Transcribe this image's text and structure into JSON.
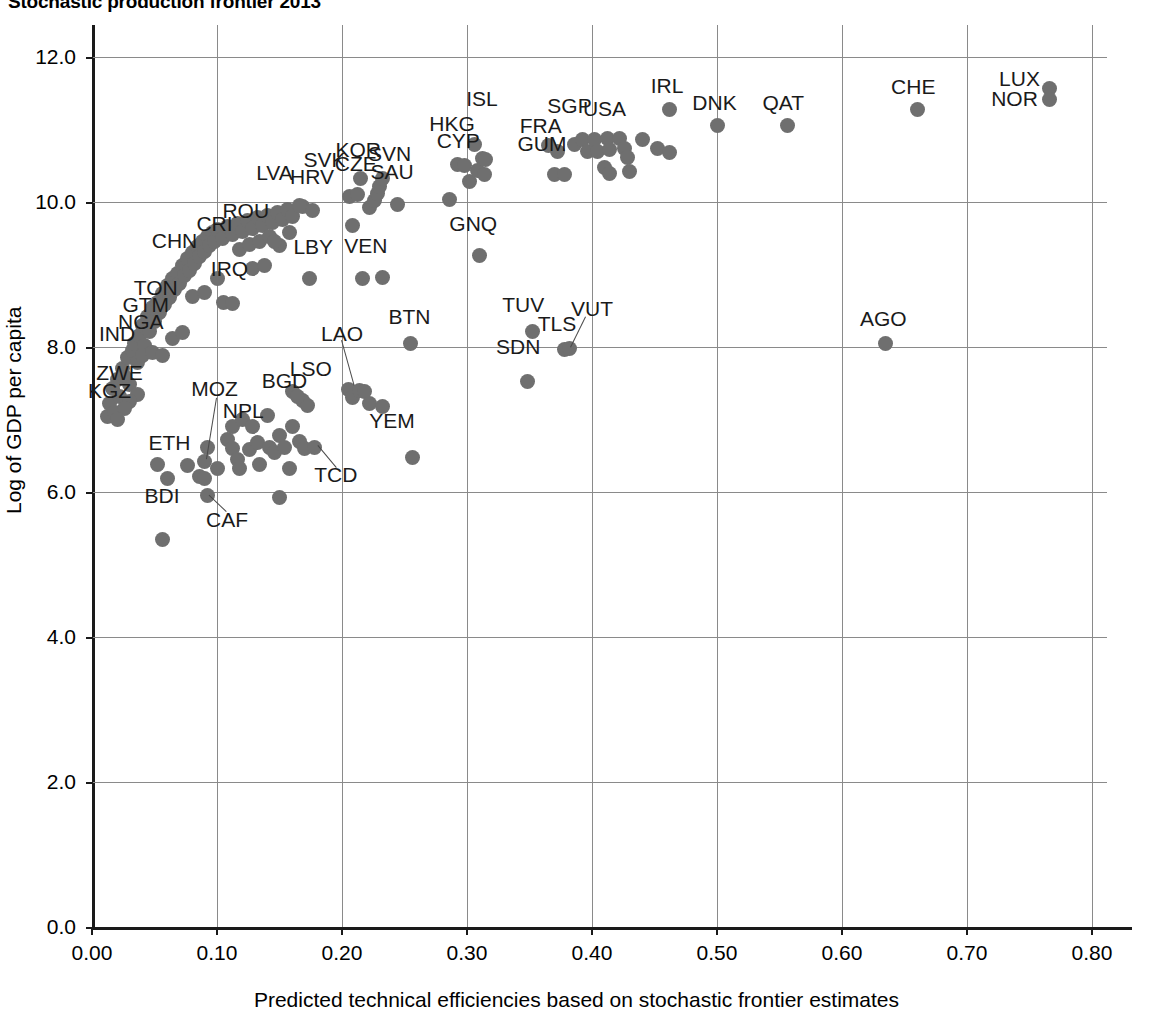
{
  "title": "Stochastic production frontier 2013",
  "axes": {
    "x_title": "Predicted technical efficiencies based on stochastic frontier estimates",
    "y_title": "Log of GDP per capita",
    "x_ticks": [
      "0.00",
      "0.10",
      "0.20",
      "0.30",
      "0.40",
      "0.50",
      "0.60",
      "0.70",
      "0.80"
    ],
    "y_ticks": [
      "0.0",
      "2.0",
      "4.0",
      "6.0",
      "8.0",
      "10.0",
      "12.0"
    ]
  },
  "style": {
    "point_color": "#6f6f6f",
    "grid_color": "#8a8a8a",
    "axis_color": "#1a1a1a"
  },
  "chart_data": {
    "type": "scatter",
    "title": "Stochastic production frontier 2013",
    "xlabel": "Predicted technical efficiencies based on stochastic frontier estimates",
    "ylabel": "Log of GDP per capita",
    "xlim": [
      0.0,
      0.8
    ],
    "ylim": [
      0.0,
      12.0
    ],
    "xticks": [
      0.0,
      0.1,
      0.2,
      0.3,
      0.4,
      0.5,
      0.6,
      0.7,
      0.8
    ],
    "yticks": [
      0.0,
      2.0,
      4.0,
      6.0,
      8.0,
      10.0,
      12.0
    ],
    "grid": true,
    "legend": "none",
    "marker": "filled-circle",
    "points": [
      {
        "x": 0.012,
        "y": 7.04
      },
      {
        "x": 0.014,
        "y": 7.22
      },
      {
        "x": 0.016,
        "y": 7.43
      },
      {
        "x": 0.018,
        "y": 7.1
      },
      {
        "x": 0.02,
        "y": 7.55
      },
      {
        "x": 0.022,
        "y": 7.32
      },
      {
        "x": 0.024,
        "y": 7.7
      },
      {
        "x": 0.026,
        "y": 7.6
      },
      {
        "x": 0.028,
        "y": 7.85
      },
      {
        "x": 0.03,
        "y": 7.48
      },
      {
        "x": 0.032,
        "y": 7.95
      },
      {
        "x": 0.034,
        "y": 8.05
      },
      {
        "x": 0.036,
        "y": 7.78
      },
      {
        "x": 0.038,
        "y": 8.16
      },
      {
        "x": 0.04,
        "y": 8.3
      },
      {
        "x": 0.042,
        "y": 8.02
      },
      {
        "x": 0.044,
        "y": 8.42
      },
      {
        "x": 0.046,
        "y": 8.22
      },
      {
        "x": 0.048,
        "y": 8.55
      },
      {
        "x": 0.05,
        "y": 8.35
      },
      {
        "x": 0.052,
        "y": 8.62
      },
      {
        "x": 0.054,
        "y": 8.48
      },
      {
        "x": 0.056,
        "y": 8.74
      },
      {
        "x": 0.058,
        "y": 8.58
      },
      {
        "x": 0.06,
        "y": 8.85
      },
      {
        "x": 0.062,
        "y": 8.68
      },
      {
        "x": 0.064,
        "y": 8.95
      },
      {
        "x": 0.066,
        "y": 8.8
      },
      {
        "x": 0.068,
        "y": 9.02
      },
      {
        "x": 0.07,
        "y": 8.88
      },
      {
        "x": 0.072,
        "y": 9.12
      },
      {
        "x": 0.074,
        "y": 8.98
      },
      {
        "x": 0.076,
        "y": 9.22
      },
      {
        "x": 0.078,
        "y": 9.05
      },
      {
        "x": 0.08,
        "y": 9.3
      },
      {
        "x": 0.082,
        "y": 9.15
      },
      {
        "x": 0.084,
        "y": 9.38
      },
      {
        "x": 0.086,
        "y": 9.25
      },
      {
        "x": 0.088,
        "y": 9.45
      },
      {
        "x": 0.09,
        "y": 9.32
      },
      {
        "x": 0.092,
        "y": 9.52
      },
      {
        "x": 0.094,
        "y": 9.4
      },
      {
        "x": 0.096,
        "y": 9.58
      },
      {
        "x": 0.098,
        "y": 9.46
      },
      {
        "x": 0.1,
        "y": 9.62
      },
      {
        "x": 0.104,
        "y": 9.5
      },
      {
        "x": 0.108,
        "y": 9.66
      },
      {
        "x": 0.112,
        "y": 9.55
      },
      {
        "x": 0.116,
        "y": 9.7
      },
      {
        "x": 0.12,
        "y": 9.6
      },
      {
        "x": 0.124,
        "y": 9.74
      },
      {
        "x": 0.128,
        "y": 9.64
      },
      {
        "x": 0.132,
        "y": 9.78
      },
      {
        "x": 0.136,
        "y": 9.68
      },
      {
        "x": 0.14,
        "y": 9.82
      },
      {
        "x": 0.144,
        "y": 9.72
      },
      {
        "x": 0.148,
        "y": 9.86
      },
      {
        "x": 0.152,
        "y": 9.76
      },
      {
        "x": 0.156,
        "y": 9.9
      },
      {
        "x": 0.16,
        "y": 9.8
      },
      {
        "x": 0.168,
        "y": 9.94
      },
      {
        "x": 0.176,
        "y": 9.88
      },
      {
        "x": 0.08,
        "y": 8.7
      },
      {
        "x": 0.09,
        "y": 8.75
      },
      {
        "x": 0.1,
        "y": 8.95
      },
      {
        "x": 0.105,
        "y": 8.62
      },
      {
        "x": 0.112,
        "y": 8.6
      },
      {
        "x": 0.118,
        "y": 9.35
      },
      {
        "x": 0.126,
        "y": 9.42
      },
      {
        "x": 0.134,
        "y": 9.46
      },
      {
        "x": 0.142,
        "y": 9.52
      },
      {
        "x": 0.15,
        "y": 9.4
      },
      {
        "x": 0.158,
        "y": 9.58
      },
      {
        "x": 0.166,
        "y": 9.95
      },
      {
        "x": 0.174,
        "y": 8.94
      },
      {
        "x": 0.128,
        "y": 9.08
      },
      {
        "x": 0.138,
        "y": 9.12
      },
      {
        "x": 0.146,
        "y": 9.45
      },
      {
        "x": 0.04,
        "y": 7.88
      },
      {
        "x": 0.048,
        "y": 7.92
      },
      {
        "x": 0.056,
        "y": 7.88
      },
      {
        "x": 0.064,
        "y": 8.12
      },
      {
        "x": 0.072,
        "y": 8.2
      },
      {
        "x": 0.036,
        "y": 7.35
      },
      {
        "x": 0.03,
        "y": 7.25
      },
      {
        "x": 0.026,
        "y": 7.15
      },
      {
        "x": 0.02,
        "y": 7.0
      },
      {
        "x": 0.052,
        "y": 6.38
      },
      {
        "x": 0.06,
        "y": 6.18
      },
      {
        "x": 0.076,
        "y": 6.36
      },
      {
        "x": 0.086,
        "y": 6.22
      },
      {
        "x": 0.09,
        "y": 6.18
      },
      {
        "x": 0.09,
        "y": 6.42
      },
      {
        "x": 0.092,
        "y": 6.62
      },
      {
        "x": 0.092,
        "y": 5.95
      },
      {
        "x": 0.1,
        "y": 6.32
      },
      {
        "x": 0.056,
        "y": 5.35
      },
      {
        "x": 0.108,
        "y": 6.72
      },
      {
        "x": 0.112,
        "y": 6.6
      },
      {
        "x": 0.112,
        "y": 6.9
      },
      {
        "x": 0.116,
        "y": 6.45
      },
      {
        "x": 0.118,
        "y": 6.32
      },
      {
        "x": 0.12,
        "y": 7.0
      },
      {
        "x": 0.126,
        "y": 6.58
      },
      {
        "x": 0.128,
        "y": 6.9
      },
      {
        "x": 0.132,
        "y": 6.68
      },
      {
        "x": 0.134,
        "y": 6.38
      },
      {
        "x": 0.14,
        "y": 7.05
      },
      {
        "x": 0.142,
        "y": 6.62
      },
      {
        "x": 0.146,
        "y": 6.55
      },
      {
        "x": 0.15,
        "y": 6.78
      },
      {
        "x": 0.154,
        "y": 6.62
      },
      {
        "x": 0.158,
        "y": 6.32
      },
      {
        "x": 0.16,
        "y": 6.9
      },
      {
        "x": 0.166,
        "y": 6.7
      },
      {
        "x": 0.17,
        "y": 6.6
      },
      {
        "x": 0.168,
        "y": 7.26
      },
      {
        "x": 0.172,
        "y": 7.2
      },
      {
        "x": 0.16,
        "y": 7.38
      },
      {
        "x": 0.164,
        "y": 7.32
      },
      {
        "x": 0.178,
        "y": 6.62
      },
      {
        "x": 0.15,
        "y": 5.92
      },
      {
        "x": 0.205,
        "y": 7.42
      },
      {
        "x": 0.208,
        "y": 7.3
      },
      {
        "x": 0.214,
        "y": 7.4
      },
      {
        "x": 0.218,
        "y": 7.38
      },
      {
        "x": 0.222,
        "y": 7.22
      },
      {
        "x": 0.232,
        "y": 7.18
      },
      {
        "x": 0.256,
        "y": 6.48
      },
      {
        "x": 0.255,
        "y": 8.05
      },
      {
        "x": 0.206,
        "y": 10.08
      },
      {
        "x": 0.208,
        "y": 9.68
      },
      {
        "x": 0.212,
        "y": 10.1
      },
      {
        "x": 0.215,
        "y": 10.32
      },
      {
        "x": 0.222,
        "y": 9.92
      },
      {
        "x": 0.226,
        "y": 10.02
      },
      {
        "x": 0.228,
        "y": 10.12
      },
      {
        "x": 0.23,
        "y": 10.22
      },
      {
        "x": 0.232,
        "y": 10.32
      },
      {
        "x": 0.244,
        "y": 9.96
      },
      {
        "x": 0.216,
        "y": 8.94
      },
      {
        "x": 0.232,
        "y": 8.96
      },
      {
        "x": 0.286,
        "y": 10.04
      },
      {
        "x": 0.292,
        "y": 10.52
      },
      {
        "x": 0.298,
        "y": 10.5
      },
      {
        "x": 0.302,
        "y": 10.28
      },
      {
        "x": 0.306,
        "y": 10.8
      },
      {
        "x": 0.308,
        "y": 10.44
      },
      {
        "x": 0.312,
        "y": 10.6
      },
      {
        "x": 0.315,
        "y": 10.58
      },
      {
        "x": 0.314,
        "y": 10.38
      },
      {
        "x": 0.31,
        "y": 9.26
      },
      {
        "x": 0.348,
        "y": 7.52
      },
      {
        "x": 0.352,
        "y": 8.22
      },
      {
        "x": 0.378,
        "y": 7.96
      },
      {
        "x": 0.382,
        "y": 7.98
      },
      {
        "x": 0.365,
        "y": 10.78
      },
      {
        "x": 0.372,
        "y": 10.7
      },
      {
        "x": 0.37,
        "y": 10.38
      },
      {
        "x": 0.378,
        "y": 10.38
      },
      {
        "x": 0.386,
        "y": 10.8
      },
      {
        "x": 0.392,
        "y": 10.86
      },
      {
        "x": 0.396,
        "y": 10.7
      },
      {
        "x": 0.402,
        "y": 10.86
      },
      {
        "x": 0.404,
        "y": 10.7
      },
      {
        "x": 0.412,
        "y": 10.88
      },
      {
        "x": 0.414,
        "y": 10.72
      },
      {
        "x": 0.41,
        "y": 10.48
      },
      {
        "x": 0.414,
        "y": 10.4
      },
      {
        "x": 0.422,
        "y": 10.88
      },
      {
        "x": 0.426,
        "y": 10.74
      },
      {
        "x": 0.428,
        "y": 10.62
      },
      {
        "x": 0.43,
        "y": 10.42
      },
      {
        "x": 0.44,
        "y": 10.86
      },
      {
        "x": 0.452,
        "y": 10.74
      },
      {
        "x": 0.462,
        "y": 11.28
      },
      {
        "x": 0.462,
        "y": 10.68
      },
      {
        "x": 0.5,
        "y": 11.06
      },
      {
        "x": 0.556,
        "y": 11.06
      },
      {
        "x": 0.635,
        "y": 8.05
      },
      {
        "x": 0.66,
        "y": 11.28
      },
      {
        "x": 0.766,
        "y": 11.56
      },
      {
        "x": 0.766,
        "y": 11.42
      }
    ],
    "labels": [
      {
        "text": "LUX",
        "x": 0.742,
        "y": 11.7
      },
      {
        "text": "NOR",
        "x": 0.738,
        "y": 11.42
      },
      {
        "text": "CHE",
        "x": 0.657,
        "y": 11.58
      },
      {
        "text": "QAT",
        "x": 0.553,
        "y": 11.37
      },
      {
        "text": "DNK",
        "x": 0.498,
        "y": 11.37
      },
      {
        "text": "IRL",
        "x": 0.46,
        "y": 11.6
      },
      {
        "text": "USA",
        "x": 0.41,
        "y": 11.28
      },
      {
        "text": "SGP",
        "x": 0.382,
        "y": 11.33
      },
      {
        "text": "FRA",
        "x": 0.359,
        "y": 11.05
      },
      {
        "text": "GUM",
        "x": 0.36,
        "y": 10.8
      },
      {
        "text": "ISL",
        "x": 0.312,
        "y": 11.42
      },
      {
        "text": "HKG",
        "x": 0.288,
        "y": 11.08
      },
      {
        "text": "CYP",
        "x": 0.293,
        "y": 10.84
      },
      {
        "text": "GNQ",
        "x": 0.305,
        "y": 9.7
      },
      {
        "text": "KOR",
        "x": 0.213,
        "y": 10.72
      },
      {
        "text": "SVN",
        "x": 0.238,
        "y": 10.66
      },
      {
        "text": "CZE",
        "x": 0.211,
        "y": 10.52
      },
      {
        "text": "SAU",
        "x": 0.24,
        "y": 10.42
      },
      {
        "text": "SVK",
        "x": 0.186,
        "y": 10.58
      },
      {
        "text": "HRV",
        "x": 0.176,
        "y": 10.35
      },
      {
        "text": "LVA",
        "x": 0.146,
        "y": 10.4
      },
      {
        "text": "ROU",
        "x": 0.123,
        "y": 9.88
      },
      {
        "text": "CRI",
        "x": 0.098,
        "y": 9.7
      },
      {
        "text": "CHN",
        "x": 0.066,
        "y": 9.46
      },
      {
        "text": "IRQ",
        "x": 0.11,
        "y": 9.08
      },
      {
        "text": "LBY",
        "x": 0.177,
        "y": 9.38
      },
      {
        "text": "VEN",
        "x": 0.219,
        "y": 9.4
      },
      {
        "text": "TON",
        "x": 0.051,
        "y": 8.82
      },
      {
        "text": "GTM",
        "x": 0.043,
        "y": 8.58
      },
      {
        "text": "NGA",
        "x": 0.039,
        "y": 8.34
      },
      {
        "text": "IND",
        "x": 0.02,
        "y": 8.18
      },
      {
        "text": "ZWE",
        "x": 0.022,
        "y": 7.64
      },
      {
        "text": "KGZ",
        "x": 0.014,
        "y": 7.4
      },
      {
        "text": "MOZ",
        "x": 0.098,
        "y": 7.42
      },
      {
        "text": "ETH",
        "x": 0.062,
        "y": 6.68
      },
      {
        "text": "BDI",
        "x": 0.056,
        "y": 5.94
      },
      {
        "text": "CAF",
        "x": 0.108,
        "y": 5.62
      },
      {
        "text": "NPL",
        "x": 0.121,
        "y": 7.12
      },
      {
        "text": "BGD",
        "x": 0.154,
        "y": 7.53
      },
      {
        "text": "LSO",
        "x": 0.175,
        "y": 7.7
      },
      {
        "text": "TCD",
        "x": 0.195,
        "y": 6.23
      },
      {
        "text": "LAO",
        "x": 0.2,
        "y": 8.18
      },
      {
        "text": "YEM",
        "x": 0.24,
        "y": 6.98
      },
      {
        "text": "BTN",
        "x": 0.254,
        "y": 8.42
      },
      {
        "text": "SDN",
        "x": 0.341,
        "y": 8.0
      },
      {
        "text": "TUV",
        "x": 0.345,
        "y": 8.58
      },
      {
        "text": "TLS",
        "x": 0.372,
        "y": 8.32
      },
      {
        "text": "VUT",
        "x": 0.4,
        "y": 8.52
      },
      {
        "text": "AGO",
        "x": 0.633,
        "y": 8.38
      }
    ],
    "leaders": [
      {
        "x1": 0.2,
        "y1": 8.1,
        "x2": 0.21,
        "y2": 7.48
      },
      {
        "x1": 0.395,
        "y1": 8.42,
        "x2": 0.383,
        "y2": 8.0
      },
      {
        "x1": 0.195,
        "y1": 6.33,
        "x2": 0.18,
        "y2": 6.64
      },
      {
        "x1": 0.107,
        "y1": 5.73,
        "x2": 0.093,
        "y2": 5.96
      },
      {
        "x1": 0.1,
        "y1": 7.3,
        "x2": 0.092,
        "y2": 6.46
      }
    ]
  }
}
